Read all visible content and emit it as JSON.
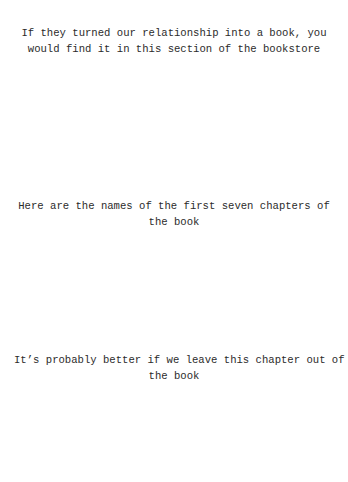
{
  "page": {
    "background": "#ffffff",
    "text_color": "#2b2b2b"
  },
  "prompts": [
    {
      "lines": [
        "If they turned our relationship into a book, you",
        "would find it in this section of the bookstore"
      ]
    },
    {
      "lines": [
        "Here are the names of the first seven chapters of",
        "the book"
      ]
    },
    {
      "lines": [
        "It’s probably better if we leave this chapter out of",
        "the book"
      ]
    }
  ]
}
